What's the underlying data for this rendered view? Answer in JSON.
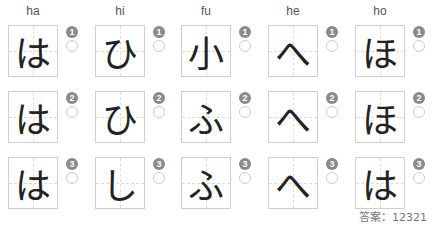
{
  "columns": [
    {
      "label": "ha",
      "options": [
        {
          "num": "1",
          "char": "は"
        },
        {
          "num": "2",
          "char": "は"
        },
        {
          "num": "3",
          "char": "は"
        }
      ]
    },
    {
      "label": "hi",
      "options": [
        {
          "num": "1",
          "char": "ひ"
        },
        {
          "num": "2",
          "char": "ひ"
        },
        {
          "num": "3",
          "char": "し"
        }
      ]
    },
    {
      "label": "fu",
      "options": [
        {
          "num": "1",
          "char": "小"
        },
        {
          "num": "2",
          "char": "ふ"
        },
        {
          "num": "3",
          "char": "ふ"
        }
      ]
    },
    {
      "label": "he",
      "options": [
        {
          "num": "1",
          "char": "へ"
        },
        {
          "num": "2",
          "char": "へ"
        },
        {
          "num": "3",
          "char": "へ"
        }
      ]
    },
    {
      "label": "ho",
      "options": [
        {
          "num": "1",
          "char": "ほ"
        },
        {
          "num": "2",
          "char": "ほ"
        },
        {
          "num": "3",
          "char": "は"
        }
      ]
    }
  ],
  "answer": "答案：12321"
}
